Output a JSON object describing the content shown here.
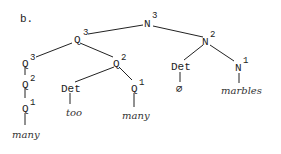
{
  "figure": {
    "label": "b.",
    "nodes": {
      "root": {
        "cat": "N",
        "level": "3"
      },
      "q3_upper": {
        "cat": "Q",
        "level": "3"
      },
      "n2": {
        "cat": "N",
        "level": "2"
      },
      "q3_left": {
        "cat": "Q",
        "level": "3"
      },
      "q2_left": {
        "cat": "Q",
        "level": "2"
      },
      "q1_left": {
        "cat": "Q",
        "level": "1"
      },
      "many_left": {
        "word": "many"
      },
      "q2_mid": {
        "cat": "Q",
        "level": "2"
      },
      "det_mid": {
        "cat": "Det"
      },
      "too": {
        "word": "too"
      },
      "q1_mid": {
        "cat": "Q",
        "level": "1"
      },
      "many_mid": {
        "word": "many"
      },
      "det_right": {
        "cat": "Det"
      },
      "empty": {
        "word": "∅"
      },
      "n1": {
        "cat": "N",
        "level": "1"
      },
      "marbles": {
        "word": "marbles"
      }
    }
  }
}
